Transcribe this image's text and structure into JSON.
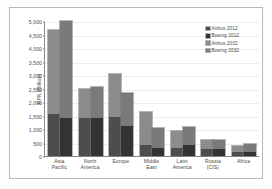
{
  "chart_data": {
    "type": "bar",
    "subtype": "grouped-stacked",
    "title": "",
    "xlabel": "",
    "ylabel": "RPK (Billion)",
    "ylim": [
      0,
      5000
    ],
    "ytick_step": 500,
    "ytick_labels": [
      "5,000",
      "4,500",
      "4,000",
      "3,500",
      "3,000",
      "2,500",
      "2,000",
      "1,500",
      "1,000",
      "500",
      "0"
    ],
    "ytick_values": [
      5000,
      4500,
      4000,
      3500,
      3000,
      2500,
      2000,
      1500,
      1000,
      500,
      0
    ],
    "grid": true,
    "legend_position": "top-right",
    "categories": [
      "Asia Pacific",
      "North America",
      "Europe",
      "Middle East",
      "Latin America",
      "Russia (CIS)",
      "Africa"
    ],
    "category_lines": [
      [
        "Asia",
        "Pacific"
      ],
      [
        "North",
        "America"
      ],
      [
        "Europe",
        ""
      ],
      [
        "Middle",
        "East"
      ],
      [
        "Latin",
        "America"
      ],
      [
        "Russia",
        "(CIS)"
      ],
      [
        "Africa",
        ""
      ]
    ],
    "series": [
      {
        "name": "Airbus 2012",
        "color": "#4d4d4d",
        "values": [
          1570,
          1400,
          1450,
          390,
          300,
          250,
          140
        ]
      },
      {
        "name": "Boeing 2012",
        "color": "#333333",
        "values": [
          1420,
          1400,
          1110,
          300,
          400,
          250,
          160
        ]
      },
      {
        "name": "Airbus 2032",
        "color": "#8c8c8c",
        "values": [
          4650,
          2500,
          3020,
          1640,
          930,
          600,
          360
        ]
      },
      {
        "name": "Boeing 2032",
        "color": "#7a7a7a",
        "values": [
          5000,
          2550,
          2330,
          1040,
          1060,
          590,
          430
        ]
      }
    ],
    "bars": [
      {
        "category": "Asia Pacific",
        "airbus": {
          "base_2012": 1570,
          "total_2032": 4650
        },
        "boeing": {
          "base_2012": 1420,
          "total_2032": 5000
        }
      },
      {
        "category": "North America",
        "airbus": {
          "base_2012": 1400,
          "total_2032": 2500
        },
        "boeing": {
          "base_2012": 1400,
          "total_2032": 2550
        }
      },
      {
        "category": "Europe",
        "airbus": {
          "base_2012": 1450,
          "total_2032": 3020
        },
        "boeing": {
          "base_2012": 1110,
          "total_2032": 2330
        }
      },
      {
        "category": "Middle East",
        "airbus": {
          "base_2012": 390,
          "total_2032": 1640
        },
        "boeing": {
          "base_2012": 300,
          "total_2032": 1040
        }
      },
      {
        "category": "Latin America",
        "airbus": {
          "base_2012": 300,
          "total_2032": 930
        },
        "boeing": {
          "base_2012": 400,
          "total_2032": 1060
        }
      },
      {
        "category": "Russia (CIS)",
        "airbus": {
          "base_2012": 250,
          "total_2032": 600
        },
        "boeing": {
          "base_2012": 250,
          "total_2032": 590
        }
      },
      {
        "category": "Africa",
        "airbus": {
          "base_2012": 140,
          "total_2032": 360
        },
        "boeing": {
          "base_2012": 160,
          "total_2032": 430
        }
      }
    ]
  },
  "legend": {
    "items": [
      {
        "label": "Airbus 2012",
        "color": "#4d4d4d"
      },
      {
        "label": "Boeing 2012",
        "color": "#333333"
      },
      {
        "label": "Airbus 2032",
        "color": "#8c8c8c"
      },
      {
        "label": "Boeing 2032",
        "color": "#7a7a7a"
      }
    ]
  },
  "colors": {
    "airbus_2012": "#4d4d4d",
    "boeing_2012": "#333333",
    "airbus_2032": "#8c8c8c",
    "boeing_2032": "#7a7a7a",
    "axis": "#8a8a8a",
    "grid": "#ececec",
    "frame": "#b9b9b9",
    "text": "#4a4a4a",
    "background": "#ffffff"
  }
}
